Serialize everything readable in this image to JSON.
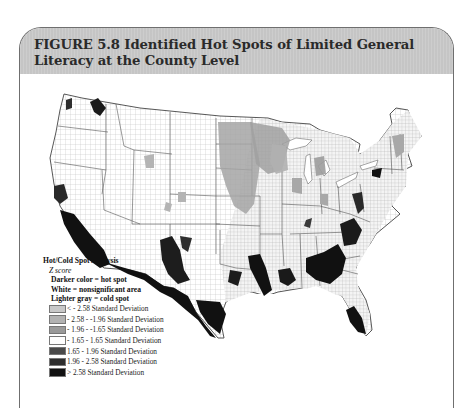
{
  "figure": {
    "title": "FIGURE 5.8  Identified Hot Spots of Limited General Literacy at the County Level"
  },
  "map": {
    "region": "Contiguous United States, county level",
    "description": "Hot spots (dark) concentrated along the US-Mexico border (California, Arizona, New Mexico, Texas), the Mississippi Delta, Alabama/Georgia black belt, Carolinas, south Florida, New York City area, and central Washington. Cold spots (light/medium gray) across the northern Great Plains (Dakotas, Minnesota, Nebraska, Iowa, Kansas), Wisconsin, Michigan, parts of Illinois/Indiana, Wyoming/Montana patches, and northern New England."
  },
  "legend": {
    "heading": "Hot/Cold Spot Analysis",
    "subheading": "Z score",
    "notes": [
      "Darker color = hot spot",
      "White = nonsignificant area",
      "Lighter  gray = cold spot"
    ],
    "items": [
      {
        "label": "< - 2.58 Standard Deviation",
        "color": "#c8c8c8"
      },
      {
        "label": "- 2.58 - -1.96 Standard Deviation",
        "color": "#b2b2b2"
      },
      {
        "label": "- 1.96 - -1.65 Standard Deviation",
        "color": "#9a9a9a"
      },
      {
        "label": "- 1.65 - 1.65 Standard Deviation",
        "color": "#ffffff"
      },
      {
        "label": "1.65 - 1.96 Standard Deviation",
        "color": "#4a4a4a"
      },
      {
        "label": "1.96 - 2.58 Standard Deviation",
        "color": "#2e2e2e"
      },
      {
        "label": "> 2.58 Standard Deviation",
        "color": "#111111"
      }
    ]
  },
  "colors": {
    "header_bg": "#c9c9c9",
    "title_text": "#2a2a2a",
    "frame_border": "#6f6f6f"
  }
}
